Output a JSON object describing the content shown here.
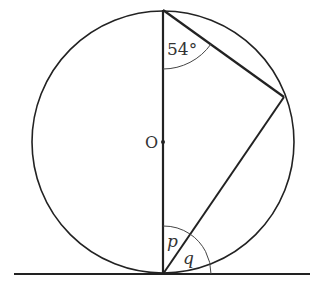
{
  "diagram": {
    "labels": {
      "angle_top": "54°",
      "center": "O",
      "angle_p": "p",
      "angle_q": "q"
    },
    "colors": {
      "stroke": "#222222",
      "text": "#333333",
      "background": "#ffffff"
    }
  }
}
